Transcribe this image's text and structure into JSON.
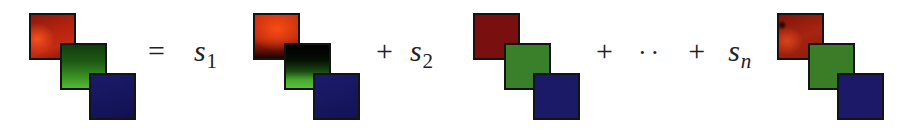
{
  "figure": {
    "groups": [
      {
        "id": "original",
        "channels": [
          "red",
          "green",
          "blue"
        ],
        "style": "textured"
      },
      {
        "id": "component-1",
        "channels": [
          "red",
          "green",
          "blue"
        ],
        "style": "dark-green-top"
      },
      {
        "id": "component-n",
        "channels": [
          "red",
          "green",
          "blue"
        ],
        "style": "flat"
      },
      {
        "id": "reconstruction",
        "channels": [
          "red",
          "green",
          "blue"
        ],
        "style": "mixed"
      }
    ],
    "colors": {
      "red": "#b8260e",
      "green": "#3a7f2a",
      "blue": "#1b1a66",
      "border": "#141414"
    },
    "equation": {
      "equals": "=",
      "plus": "+",
      "ellipsis": "··",
      "s1_var": "s",
      "s1_sub": "1",
      "s2_var": "s",
      "s2_sub": "2",
      "sn_var": "s",
      "sn_sub": "n"
    }
  }
}
